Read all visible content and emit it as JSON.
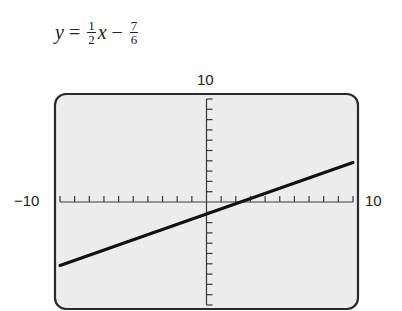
{
  "equation": {
    "lhs": "y",
    "equals": "=",
    "coef_num": "1",
    "coef_den": "2",
    "var": "x",
    "minus": "−",
    "const_num": "7",
    "const_den": "6"
  },
  "labels": {
    "ymax": "10",
    "xmin": "−10",
    "xmax": "10"
  },
  "colors": {
    "screen": "#ececec",
    "frame": "#2a2a2a",
    "line": "#111111",
    "axis": "#3a3a3a"
  },
  "chart_data": {
    "type": "line",
    "xlabel": "",
    "ylabel": "",
    "xlim": [
      -10,
      10
    ],
    "ylim": [
      -10,
      10
    ],
    "xscale": 1,
    "yscale": 1,
    "grid": false,
    "tick_labels": {
      "xmin": "−10",
      "xmax": "10",
      "ymax": "10"
    },
    "series": [
      {
        "name": "y = 1/2 x − 7/6",
        "x": [
          -10,
          -5,
          0,
          2.333,
          5,
          10
        ],
        "y": [
          -6.167,
          -3.667,
          -1.167,
          0,
          1.333,
          3.833
        ]
      }
    ]
  }
}
